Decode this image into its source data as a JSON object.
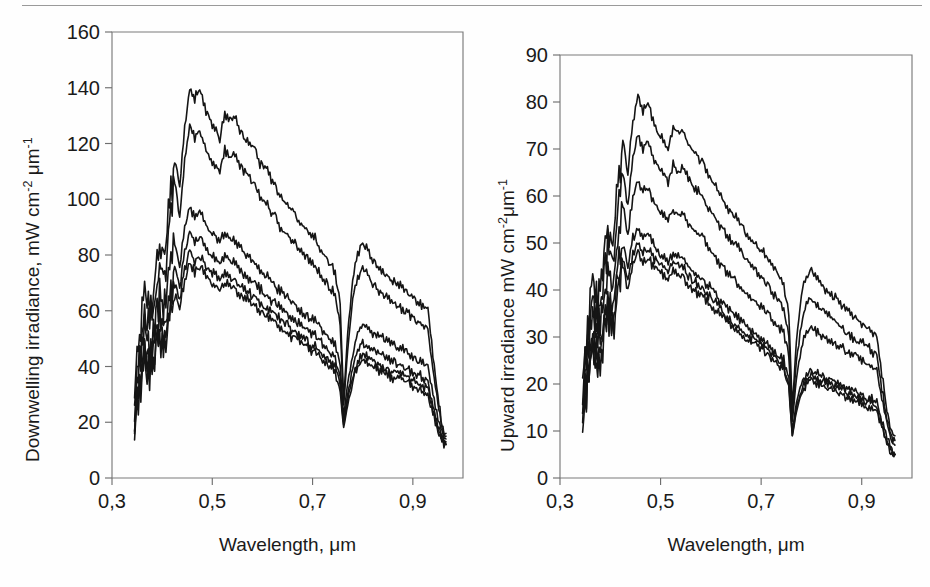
{
  "figure": {
    "background_color": "#fefefe",
    "line_color": "#151515",
    "axis_color": "#6f6f6f",
    "top_rule": "horizontal-rule-artifact"
  },
  "panels": [
    {
      "id": "downwelling",
      "y_title_main": "Downwelling irradiance, mW cm",
      "y_title_exp1": "-2",
      "y_title_mid": " μm",
      "y_title_exp2": "-1",
      "x_title": "Wavelength, μm"
    },
    {
      "id": "upward",
      "y_title_main": "Upward irradiance mW cm",
      "y_title_exp1": "-2",
      "y_title_mid": "μm",
      "y_title_exp2": "-1",
      "x_title": "Wavelength, μm"
    }
  ],
  "chart_data": [
    {
      "type": "line",
      "id": "downwelling-irradiance",
      "title": "",
      "xlabel": "Wavelength, μm",
      "ylabel": "Downwelling irradiance, mW cm-2 μm-1",
      "xlim": [
        0.3,
        1.0
      ],
      "ylim": [
        0,
        160
      ],
      "xticks": [
        0.3,
        0.5,
        0.7,
        0.9
      ],
      "xticklabels": [
        "0,3",
        "0,5",
        "0,7",
        "0,9"
      ],
      "yticks": [
        0,
        20,
        40,
        60,
        80,
        100,
        120,
        140,
        160
      ],
      "yticklabels": [
        "0",
        "20",
        "40",
        "60",
        "80",
        "100",
        "120",
        "140",
        "160"
      ],
      "grid": false,
      "legend": "none",
      "n_series": 6,
      "x": [
        0.345,
        0.355,
        0.365,
        0.375,
        0.385,
        0.395,
        0.405,
        0.415,
        0.425,
        0.435,
        0.445,
        0.455,
        0.465,
        0.475,
        0.485,
        0.495,
        0.505,
        0.515,
        0.525,
        0.535,
        0.545,
        0.555,
        0.565,
        0.575,
        0.585,
        0.595,
        0.605,
        0.615,
        0.625,
        0.635,
        0.645,
        0.655,
        0.665,
        0.675,
        0.685,
        0.695,
        0.705,
        0.715,
        0.725,
        0.735,
        0.745,
        0.755,
        0.762,
        0.77,
        0.78,
        0.79,
        0.8,
        0.81,
        0.82,
        0.83,
        0.84,
        0.85,
        0.86,
        0.87,
        0.88,
        0.89,
        0.9,
        0.91,
        0.92,
        0.93,
        0.94,
        0.95,
        0.958,
        0.966
      ],
      "series": [
        {
          "name": "curve-1-top",
          "values": [
            30,
            52,
            68,
            58,
            72,
            86,
            78,
            100,
            115,
            104,
            126,
            139,
            136,
            140,
            133,
            128,
            126,
            122,
            131,
            128,
            130,
            125,
            122,
            120,
            118,
            113,
            112,
            108,
            105,
            101,
            100,
            97,
            95,
            91,
            90,
            88,
            86,
            82,
            80,
            77,
            74,
            62,
            28,
            52,
            72,
            81,
            84,
            82,
            78,
            76,
            74,
            72,
            71,
            70,
            68,
            66,
            65,
            63,
            62,
            60,
            44,
            30,
            18,
            16
          ]
        },
        {
          "name": "curve-2",
          "values": [
            28,
            46,
            60,
            52,
            64,
            78,
            70,
            90,
            106,
            94,
            114,
            126,
            122,
            125,
            119,
            114,
            112,
            110,
            118,
            115,
            116,
            112,
            110,
            108,
            105,
            101,
            100,
            96,
            94,
            90,
            89,
            86,
            84,
            81,
            80,
            78,
            76,
            73,
            71,
            68,
            66,
            55,
            26,
            46,
            64,
            72,
            75,
            73,
            70,
            68,
            66,
            64,
            63,
            62,
            60,
            59,
            58,
            56,
            55,
            53,
            39,
            27,
            17,
            15
          ]
        },
        {
          "name": "curve-3",
          "values": [
            25,
            40,
            52,
            45,
            55,
            67,
            60,
            74,
            84,
            76,
            90,
            97,
            94,
            96,
            92,
            88,
            87,
            85,
            88,
            86,
            85,
            83,
            81,
            79,
            77,
            75,
            73,
            71,
            69,
            67,
            66,
            64,
            62,
            60,
            59,
            57,
            56,
            54,
            52,
            50,
            48,
            40,
            22,
            34,
            45,
            52,
            55,
            54,
            52,
            51,
            50,
            49,
            48,
            47,
            46,
            45,
            44,
            42,
            41,
            40,
            30,
            22,
            16,
            14
          ]
        },
        {
          "name": "curve-4",
          "values": [
            22,
            36,
            47,
            41,
            50,
            60,
            54,
            66,
            76,
            69,
            81,
            88,
            85,
            87,
            83,
            80,
            79,
            77,
            80,
            78,
            77,
            75,
            73,
            71,
            70,
            68,
            66,
            64,
            63,
            61,
            60,
            58,
            56,
            55,
            54,
            52,
            51,
            49,
            47,
            45,
            43,
            36,
            20,
            30,
            40,
            46,
            48,
            47,
            46,
            45,
            44,
            43,
            42,
            41,
            40,
            39,
            38,
            37,
            36,
            35,
            26,
            19,
            15,
            13
          ]
        },
        {
          "name": "curve-5",
          "values": [
            20,
            33,
            43,
            38,
            46,
            55,
            50,
            61,
            70,
            64,
            75,
            81,
            78,
            80,
            77,
            74,
            73,
            71,
            74,
            72,
            71,
            69,
            68,
            66,
            65,
            63,
            61,
            60,
            58,
            57,
            56,
            54,
            52,
            51,
            50,
            48,
            47,
            45,
            44,
            42,
            40,
            33,
            19,
            28,
            37,
            42,
            44,
            43,
            42,
            41,
            40,
            39,
            38,
            38,
            37,
            36,
            35,
            34,
            33,
            32,
            24,
            18,
            14,
            12
          ]
        },
        {
          "name": "curve-6-bottom",
          "values": [
            19,
            31,
            41,
            36,
            44,
            52,
            47,
            58,
            66,
            61,
            71,
            77,
            74,
            76,
            73,
            70,
            69,
            68,
            70,
            69,
            68,
            66,
            65,
            63,
            62,
            60,
            59,
            57,
            56,
            54,
            53,
            51,
            50,
            49,
            48,
            46,
            45,
            43,
            42,
            40,
            38,
            31,
            18,
            26,
            35,
            40,
            42,
            41,
            40,
            39,
            38,
            37,
            36,
            36,
            35,
            34,
            33,
            32,
            31,
            30,
            23,
            17,
            13,
            12
          ]
        }
      ]
    },
    {
      "type": "line",
      "id": "upward-irradiance",
      "title": "",
      "xlabel": "Wavelength, μm",
      "ylabel": "Upward irradiance mW cm-2 μm-1",
      "xlim": [
        0.3,
        1.0
      ],
      "ylim": [
        0,
        90
      ],
      "xticks": [
        0.3,
        0.5,
        0.7,
        0.9
      ],
      "xticklabels": [
        "0,3",
        "0,5",
        "0,7",
        "0,9"
      ],
      "yticks": [
        0,
        10,
        20,
        30,
        40,
        50,
        60,
        70,
        80,
        90
      ],
      "yticklabels": [
        "0",
        "10",
        "20",
        "30",
        "40",
        "50",
        "60",
        "70",
        "80",
        "90"
      ],
      "grid": false,
      "legend": "none",
      "n_series": 6,
      "x": [
        0.345,
        0.355,
        0.365,
        0.375,
        0.385,
        0.395,
        0.405,
        0.415,
        0.425,
        0.435,
        0.445,
        0.455,
        0.465,
        0.475,
        0.485,
        0.495,
        0.505,
        0.515,
        0.525,
        0.535,
        0.545,
        0.555,
        0.565,
        0.575,
        0.585,
        0.595,
        0.605,
        0.615,
        0.625,
        0.635,
        0.645,
        0.655,
        0.665,
        0.675,
        0.685,
        0.695,
        0.705,
        0.715,
        0.725,
        0.735,
        0.745,
        0.755,
        0.762,
        0.77,
        0.78,
        0.79,
        0.8,
        0.81,
        0.82,
        0.83,
        0.84,
        0.85,
        0.86,
        0.87,
        0.88,
        0.89,
        0.9,
        0.91,
        0.92,
        0.93,
        0.94,
        0.95,
        0.958,
        0.966
      ],
      "series": [
        {
          "name": "curve-1-top",
          "values": [
            21,
            32,
            42,
            36,
            45,
            55,
            49,
            63,
            72,
            65,
            76,
            81,
            78,
            80,
            76,
            73,
            72,
            70,
            75,
            73,
            74,
            71,
            70,
            68,
            67,
            64,
            63,
            61,
            59,
            57,
            56,
            55,
            53,
            51,
            50,
            49,
            48,
            46,
            45,
            43,
            41,
            35,
            15,
            29,
            39,
            43,
            44,
            43,
            41,
            40,
            39,
            38,
            37,
            36,
            35,
            34,
            33,
            32,
            31,
            30,
            22,
            15,
            10,
            9
          ]
        },
        {
          "name": "curve-2",
          "values": [
            19,
            29,
            38,
            33,
            41,
            50,
            45,
            56,
            65,
            58,
            68,
            73,
            70,
            72,
            68,
            66,
            65,
            63,
            67,
            65,
            66,
            64,
            62,
            61,
            60,
            57,
            56,
            54,
            53,
            51,
            50,
            49,
            47,
            46,
            45,
            43,
            42,
            41,
            39,
            38,
            36,
            30,
            13,
            25,
            33,
            37,
            38,
            37,
            36,
            35,
            34,
            33,
            32,
            31,
            30,
            29,
            29,
            28,
            27,
            26,
            19,
            13,
            9,
            8
          ]
        },
        {
          "name": "curve-3",
          "values": [
            17,
            26,
            34,
            30,
            37,
            45,
            40,
            50,
            58,
            52,
            60,
            63,
            61,
            62,
            59,
            57,
            56,
            55,
            57,
            56,
            56,
            54,
            53,
            52,
            51,
            49,
            48,
            46,
            45,
            43,
            43,
            41,
            40,
            39,
            38,
            37,
            36,
            35,
            33,
            32,
            31,
            26,
            12,
            21,
            28,
            31,
            32,
            31,
            30,
            30,
            29,
            28,
            28,
            27,
            26,
            26,
            25,
            24,
            24,
            23,
            17,
            12,
            8,
            7
          ]
        },
        {
          "name": "curve-4",
          "values": [
            15,
            23,
            30,
            27,
            33,
            40,
            36,
            44,
            50,
            45,
            51,
            53,
            51,
            52,
            50,
            48,
            47,
            46,
            48,
            47,
            47,
            45,
            44,
            43,
            42,
            41,
            40,
            38,
            37,
            36,
            35,
            34,
            33,
            32,
            31,
            30,
            29,
            28,
            27,
            26,
            25,
            21,
            10,
            16,
            20,
            22,
            23,
            22,
            22,
            21,
            21,
            20,
            20,
            19,
            19,
            18,
            18,
            17,
            17,
            16,
            12,
            9,
            6,
            5
          ]
        },
        {
          "name": "curve-5",
          "values": [
            14,
            21,
            28,
            25,
            31,
            37,
            33,
            41,
            47,
            42,
            48,
            50,
            48,
            49,
            47,
            46,
            45,
            44,
            46,
            45,
            45,
            43,
            42,
            41,
            40,
            39,
            38,
            37,
            35,
            34,
            33,
            32,
            31,
            30,
            30,
            29,
            28,
            27,
            26,
            25,
            24,
            20,
            9,
            15,
            19,
            21,
            22,
            21,
            21,
            20,
            20,
            19,
            19,
            18,
            18,
            17,
            17,
            16,
            16,
            15,
            11,
            8,
            6,
            5
          ]
        },
        {
          "name": "curve-6-bottom",
          "values": [
            13,
            20,
            26,
            23,
            29,
            35,
            31,
            39,
            45,
            40,
            46,
            48,
            46,
            47,
            45,
            44,
            43,
            42,
            44,
            43,
            43,
            41,
            40,
            39,
            39,
            37,
            36,
            35,
            34,
            33,
            32,
            31,
            30,
            29,
            29,
            28,
            27,
            26,
            25,
            24,
            23,
            19,
            9,
            14,
            18,
            20,
            21,
            20,
            20,
            19,
            19,
            18,
            18,
            17,
            17,
            16,
            16,
            15,
            15,
            14,
            11,
            8,
            5,
            5
          ]
        }
      ]
    }
  ]
}
